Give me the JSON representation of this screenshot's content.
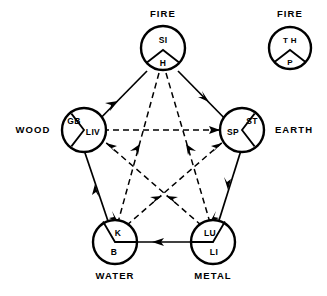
{
  "figure": {
    "background_color": "#ffffff",
    "line_color": "#000000"
  },
  "elements": [
    {
      "id": "fire",
      "label": "FIRE",
      "label_position": "top",
      "outer_organ": "SI",
      "inner_organ": "H",
      "wedge_position": "bottom"
    },
    {
      "id": "wood",
      "label": "WOOD",
      "label_position": "left",
      "outer_organ": "GB",
      "inner_organ": "LIV",
      "wedge_position": "right"
    },
    {
      "id": "earth",
      "label": "EARTH",
      "label_position": "right",
      "outer_organ": "ST",
      "inner_organ": "SP",
      "wedge_position": "left"
    },
    {
      "id": "metal",
      "label": "METAL",
      "label_position": "bottom",
      "outer_organ": "LI",
      "inner_organ": "LU",
      "wedge_position": "top-left"
    },
    {
      "id": "water",
      "label": "WATER",
      "label_position": "bottom",
      "outer_organ": "B",
      "inner_organ": "K",
      "wedge_position": "top-right"
    }
  ],
  "inset": {
    "label": "FIRE",
    "outer_organ": "T H",
    "inner_organ": "P",
    "wedge_position": "bottom"
  },
  "generating_cycle": {
    "name": "generating-cycle",
    "line_style": "solid",
    "edges": [
      {
        "from": "LIV",
        "to": "H"
      },
      {
        "from": "H",
        "to": "SP"
      },
      {
        "from": "SP",
        "to": "LU"
      },
      {
        "from": "LU",
        "to": "K"
      },
      {
        "from": "K",
        "to": "LIV"
      }
    ]
  },
  "controlling_cycle": {
    "name": "controlling-cycle",
    "line_style": "dashed",
    "edges": [
      {
        "from": "LIV",
        "to": "SP"
      },
      {
        "from": "H",
        "to": "LU"
      },
      {
        "from": "H",
        "to": "K"
      },
      {
        "from": "K",
        "to": "SP"
      },
      {
        "from": "LU",
        "to": "LIV"
      }
    ]
  }
}
